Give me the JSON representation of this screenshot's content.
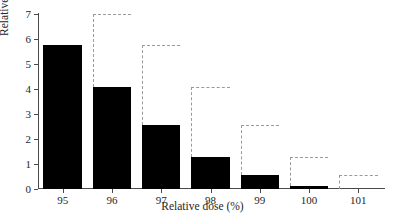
{
  "chart_data": {
    "type": "bar",
    "title": "",
    "subtitle": "",
    "xlabel": "Relative dose (%)",
    "ylabel": "Relative volume (%)",
    "categories": [
      "95",
      "96",
      "97",
      "98",
      "99",
      "100",
      "101"
    ],
    "values": [
      5.75,
      4.1,
      2.55,
      1.28,
      0.55,
      0.12,
      0
    ],
    "series": [
      {
        "name": "Relative volume",
        "values": [
          5.75,
          4.1,
          2.55,
          1.28,
          0.55,
          0.12,
          0
        ]
      }
    ],
    "outline_series": {
      "name": "dashed step outline",
      "description": "gray dashed step outline offset one category to the right of each bar",
      "values": [
        7.0,
        5.75,
        4.1,
        2.55,
        1.28,
        0.55,
        0.12
      ]
    },
    "ylim": [
      0,
      7
    ],
    "yticks": [
      "0",
      "1",
      "2",
      "3",
      "4",
      "5",
      "6",
      "7"
    ],
    "xticks": [
      "95",
      "96",
      "97",
      "98",
      "99",
      "100",
      "101"
    ],
    "grid": false,
    "legend": null,
    "legend_position": "none",
    "colors": {
      "bar_fill": "#000000",
      "outline_dashed": "#9a9a9a",
      "axis": "#4a4a4a",
      "text": "#262626",
      "background": "#ffffff"
    }
  }
}
